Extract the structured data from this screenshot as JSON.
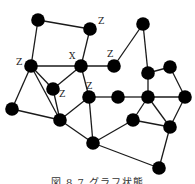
{
  "figure": {
    "caption": "図 8.7 グラフ状態",
    "node_color": "#000000",
    "edge_color": "#1a1a1a"
  },
  "graph": {
    "nodes": [
      {
        "id": 0,
        "x": 38,
        "y": 20,
        "label": ""
      },
      {
        "id": 1,
        "x": 90,
        "y": 29,
        "label": "Z"
      },
      {
        "id": 2,
        "x": 31,
        "y": 66,
        "label": "Z"
      },
      {
        "id": 3,
        "x": 81,
        "y": 66,
        "label": "X"
      },
      {
        "id": 4,
        "x": 143,
        "y": 24,
        "label": ""
      },
      {
        "id": 5,
        "x": 114,
        "y": 66,
        "label": "Z"
      },
      {
        "id": 6,
        "x": 148,
        "y": 73,
        "label": ""
      },
      {
        "id": 7,
        "x": 170,
        "y": 67,
        "label": ""
      },
      {
        "id": 8,
        "x": 53,
        "y": 89,
        "label": "Z"
      },
      {
        "id": 9,
        "x": 12,
        "y": 109,
        "label": ""
      },
      {
        "id": 10,
        "x": 60,
        "y": 120,
        "label": ""
      },
      {
        "id": 11,
        "x": 89,
        "y": 97,
        "label": "Z"
      },
      {
        "id": 12,
        "x": 118,
        "y": 97,
        "label": ""
      },
      {
        "id": 13,
        "x": 148,
        "y": 97,
        "label": ""
      },
      {
        "id": 14,
        "x": 185,
        "y": 97,
        "label": ""
      },
      {
        "id": 15,
        "x": 133,
        "y": 120,
        "label": ""
      },
      {
        "id": 16,
        "x": 170,
        "y": 127,
        "label": ""
      },
      {
        "id": 17,
        "x": 93,
        "y": 143,
        "label": ""
      },
      {
        "id": 18,
        "x": 159,
        "y": 168,
        "label": ""
      }
    ],
    "edges": [
      [
        0,
        1
      ],
      [
        0,
        2
      ],
      [
        1,
        3
      ],
      [
        2,
        3
      ],
      [
        2,
        8
      ],
      [
        2,
        9
      ],
      [
        2,
        10
      ],
      [
        3,
        5
      ],
      [
        3,
        8
      ],
      [
        3,
        11
      ],
      [
        5,
        4
      ],
      [
        4,
        6
      ],
      [
        6,
        7
      ],
      [
        6,
        13
      ],
      [
        7,
        14
      ],
      [
        8,
        10
      ],
      [
        9,
        10
      ],
      [
        10,
        11
      ],
      [
        10,
        17
      ],
      [
        11,
        12
      ],
      [
        11,
        17
      ],
      [
        12,
        13
      ],
      [
        13,
        14
      ],
      [
        13,
        15
      ],
      [
        13,
        16
      ],
      [
        15,
        16
      ],
      [
        15,
        17
      ],
      [
        14,
        16
      ],
      [
        16,
        18
      ],
      [
        17,
        18
      ]
    ]
  }
}
